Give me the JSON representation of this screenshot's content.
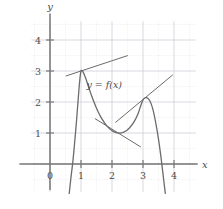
{
  "chart_data": {
    "type": "line",
    "title": "",
    "xlabel": "x",
    "ylabel": "y",
    "xlim": [
      -0.6,
      4.7
    ],
    "ylim": [
      -0.9,
      4.6
    ],
    "grid": true,
    "grid_minor_step": 0.5,
    "legend": "none",
    "xticks": [
      "0",
      "1",
      "2",
      "3",
      "4"
    ],
    "xtick_values": [
      0,
      1,
      2,
      3,
      4
    ],
    "yticks": [
      "1",
      "2",
      "3",
      "4"
    ],
    "ytick_values": [
      1,
      2,
      3,
      4
    ],
    "annotations": [
      {
        "text": "y = f(x)",
        "x": 1.75,
        "y": 2.45
      }
    ],
    "series": [
      {
        "name": "f(x)",
        "type": "curve",
        "color": "#6b6b6b",
        "points": [
          [
            0.62,
            -0.95
          ],
          [
            0.68,
            -0.4
          ],
          [
            0.74,
            0.1
          ],
          [
            0.8,
            0.75
          ],
          [
            0.86,
            1.45
          ],
          [
            0.91,
            2.1
          ],
          [
            0.96,
            2.7
          ],
          [
            1.0,
            3.0
          ],
          [
            1.06,
            2.98
          ],
          [
            1.14,
            2.8
          ],
          [
            1.24,
            2.5
          ],
          [
            1.36,
            2.15
          ],
          [
            1.5,
            1.8
          ],
          [
            1.66,
            1.48
          ],
          [
            1.84,
            1.22
          ],
          [
            2.02,
            1.06
          ],
          [
            2.2,
            1.0
          ],
          [
            2.38,
            1.03
          ],
          [
            2.54,
            1.14
          ],
          [
            2.7,
            1.34
          ],
          [
            2.84,
            1.62
          ],
          [
            2.94,
            1.92
          ],
          [
            3.02,
            2.1
          ],
          [
            3.12,
            2.14
          ],
          [
            3.22,
            2.04
          ],
          [
            3.32,
            1.76
          ],
          [
            3.42,
            1.28
          ],
          [
            3.5,
            0.8
          ],
          [
            3.58,
            0.22
          ],
          [
            3.66,
            -0.45
          ],
          [
            3.72,
            -0.95
          ]
        ]
      },
      {
        "name": "tangent-at-x1",
        "type": "tangent",
        "color": "#6b6b6b",
        "tangent_point": [
          1,
          3
        ],
        "slope": 0.33,
        "x_from": 0.52,
        "x_to": 2.5
      },
      {
        "name": "tangent-at-minimum",
        "type": "tangent",
        "color": "#6b6b6b",
        "tangent_point": [
          2.2,
          1.0
        ],
        "slope": -0.62,
        "x_from": 1.46,
        "x_to": 2.92
      },
      {
        "name": "tangent-at-x3",
        "type": "tangent",
        "color": "#6b6b6b",
        "tangent_point": [
          3.05,
          2.12
        ],
        "slope": 0.83,
        "x_from": 2.12,
        "x_to": 3.95
      }
    ]
  },
  "figure": {
    "axis_color": "#777777",
    "curve_color": "#6b6b6b",
    "grid_major_color": "#c9c9d4",
    "grid_minor_color": "#e2e2ea",
    "background": "#ffffff",
    "x_axis_label": "x",
    "y_axis_label": "y",
    "curve_label": "y = f(x)"
  }
}
